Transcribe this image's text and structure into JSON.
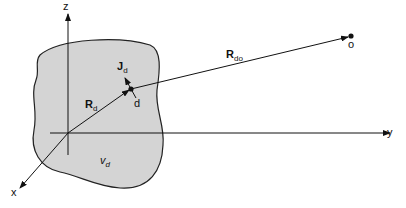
{
  "diagram": {
    "axes": {
      "z_label": "z",
      "y_label": "y",
      "x_label": "x"
    },
    "region": {
      "label": "v",
      "label_sub": "d",
      "fill": "#d4d4d4"
    },
    "vectors": {
      "R_d": {
        "label": "R",
        "sub": "d"
      },
      "R_do": {
        "label": "R",
        "sub": "do"
      },
      "J_d": {
        "label": "J",
        "sub": "d"
      }
    },
    "points": {
      "source": "d",
      "observer": "o"
    }
  }
}
